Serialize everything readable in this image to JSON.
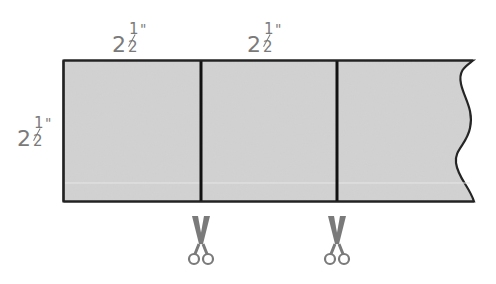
{
  "diagram": {
    "title": "",
    "strip": {
      "fill_color": "#d2d2d2",
      "outline_color": "#222222",
      "right_edge": "wavy-torn",
      "segments": 3
    },
    "dimensions": {
      "top_left": {
        "whole": "2",
        "numerator": "1",
        "denominator": "2",
        "unit": "\""
      },
      "top_middle": {
        "whole": "2",
        "numerator": "1",
        "denominator": "2",
        "unit": "\""
      },
      "left_height": {
        "whole": "2",
        "numerator": "1",
        "denominator": "2",
        "unit": "\""
      }
    },
    "cut_lines": [
      {
        "name": "cut-line-1",
        "icon": "scissors-icon"
      },
      {
        "name": "cut-line-2",
        "icon": "scissors-icon"
      }
    ],
    "colors": {
      "label": "#7a7a7a",
      "scissors": "#7a7a7a",
      "divider": "#111111"
    }
  }
}
